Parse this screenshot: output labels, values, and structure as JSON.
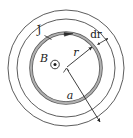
{
  "figure": {
    "type": "physics-diagram",
    "canvas": {
      "width": 133,
      "height": 138
    },
    "colors": {
      "background": "#ffffff",
      "outline": "#4a4a4a",
      "ring_fill": "#a8a8a8",
      "ring_stroke": "#5a5a5a",
      "label": "#1a1a1a",
      "leader": "#2a2a2a"
    },
    "center": {
      "x": 66,
      "y": 68
    },
    "circles": [
      {
        "name": "outer-boundary-circle",
        "radius": 58,
        "stroke_width": 0.9
      },
      {
        "name": "inner-boundary-circle",
        "radius": 49,
        "stroke_width": 0.9
      },
      {
        "name": "current-ring",
        "radius": 35,
        "stroke_width": 3.4
      }
    ],
    "labels": {
      "current_density": "J",
      "magnetic_field": "B",
      "ring_radius": "r",
      "ring_thickness": "dr",
      "conductor_radius": "a"
    },
    "symbols": {
      "field_out_of_page": "circle-dot-icon",
      "current_direction": "arrowhead-clockwise-icon"
    },
    "annotations": {
      "r_arrow": {
        "from": "center",
        "to": "current-ring",
        "double_headed": false
      },
      "dr_arrow": {
        "spans": "ring thickness",
        "double_headed": true
      },
      "a_arrow": {
        "from": "center",
        "to": "outer-boundary-circle",
        "double_headed": false
      }
    }
  }
}
